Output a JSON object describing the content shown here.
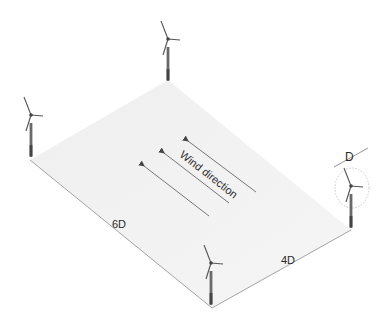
{
  "diagram": {
    "type": "wind-farm-layout",
    "labels": {
      "wind_direction": "Wind direction",
      "rotor_diameter": "D",
      "crosswind_spacing": "4D",
      "downwind_spacing": "6D"
    },
    "turbines": [
      {
        "id": "turbine-top",
        "x": 168,
        "y": 80
      },
      {
        "id": "turbine-left",
        "x": 30,
        "y": 160
      },
      {
        "id": "turbine-right",
        "x": 351,
        "y": 230
      },
      {
        "id": "turbine-bottom",
        "x": 212,
        "y": 308
      }
    ],
    "platform": {
      "corners": [
        [
          168,
          80
        ],
        [
          351,
          230
        ],
        [
          212,
          308
        ],
        [
          30,
          160
        ]
      ],
      "fill": "#f1f1f1"
    },
    "colors": {
      "line": "#8a8a8a",
      "tower": "#555555",
      "text": "#2a2a2a"
    }
  }
}
